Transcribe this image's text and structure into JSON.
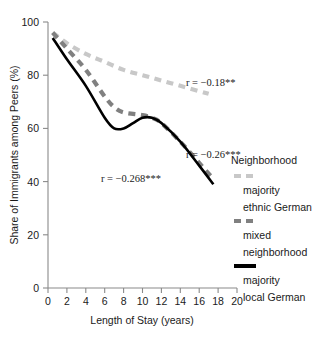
{
  "chart_data": {
    "type": "line",
    "title": "",
    "xlabel": "Length of Stay (years)",
    "ylabel": "Share of Immigrants among Peers (%)",
    "xlim": [
      0,
      20
    ],
    "ylim": [
      0,
      100
    ],
    "xticks": [
      "0",
      "2",
      "4",
      "6",
      "8",
      "10",
      "12",
      "14",
      "16",
      "18",
      "20"
    ],
    "yticks": [
      "0",
      "20",
      "40",
      "60",
      "80",
      "100"
    ],
    "grid": false,
    "legend_position": "right",
    "series": [
      {
        "name": "majority ethnic German",
        "style": "dashed",
        "color": "#c8c8c8",
        "x": [
          0.5,
          2,
          4,
          6,
          8,
          10,
          12,
          14,
          16,
          17
        ],
        "values": [
          96,
          92,
          88,
          85,
          82,
          80,
          78,
          76,
          74,
          73
        ]
      },
      {
        "name": "mixed neighborhood",
        "style": "dashed",
        "color": "#808080",
        "x": [
          0.5,
          2,
          4,
          6,
          7,
          8,
          10,
          11,
          12,
          14,
          16,
          17.5
        ],
        "values": [
          96,
          90,
          82,
          72,
          68,
          66,
          65,
          64,
          62,
          55,
          47,
          41
        ]
      },
      {
        "name": "majority local German",
        "style": "solid",
        "color": "#000000",
        "x": [
          0.5,
          2,
          4,
          6,
          7,
          8,
          9,
          10,
          11,
          12,
          14,
          16,
          17.5
        ],
        "values": [
          94,
          86,
          76,
          64,
          60,
          60,
          62,
          64,
          64,
          62,
          55,
          46,
          39
        ]
      }
    ],
    "annotations": [
      {
        "text": "r = −0.18**",
        "x": 17.1,
        "y": 79
      },
      {
        "text": "r = −0.26***",
        "x": 17.1,
        "y": 52
      },
      {
        "text": "r = −0.268***",
        "x": 8.0,
        "y": 41
      }
    ]
  },
  "legend": {
    "title": "Neighborhood",
    "items": [
      {
        "label_line1": "majority",
        "label_line2": "ethnic German",
        "swatch": "dashed-light"
      },
      {
        "label_line1": "mixed",
        "label_line2": "neighborhood",
        "swatch": "dashed-dark"
      },
      {
        "label_line1": "majority",
        "label_line2": "local German",
        "swatch": "solid-black"
      }
    ]
  },
  "colors": {
    "majority_ethnic_german": "#c8c8c8",
    "mixed_neighborhood": "#808080",
    "majority_local_german": "#000000",
    "axis": "#8a8a8a",
    "text": "#1a1a1a",
    "background": "#ffffff"
  }
}
